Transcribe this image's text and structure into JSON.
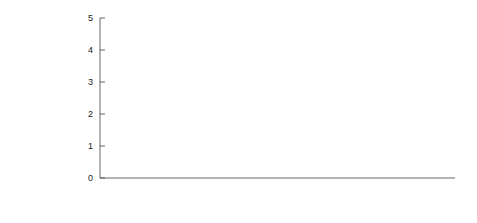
{
  "figure": {
    "background": "#ffffff",
    "xlabel": "Year",
    "left_axis": {
      "label": "Airline fuel cost, $/L",
      "ticks": [
        "0",
        "5",
        "10",
        "15"
      ],
      "tickvals": [
        0,
        5,
        10,
        15
      ],
      "lim": [
        0,
        15
      ]
    },
    "right_axis": {
      "label": "Airline fuel cost, $/gal",
      "ticks": [
        "0",
        "1",
        "2",
        "3",
        "4",
        "5"
      ],
      "tickvals": [
        0,
        1,
        2,
        3,
        4,
        5
      ],
      "lim": [
        0,
        5
      ]
    },
    "xticks": [
      "2000",
      "2002",
      "2004",
      "2006",
      "2008",
      "2010",
      "2012",
      "2014"
    ],
    "xtickvals": [
      2000,
      2002,
      2004,
      2006,
      2008,
      2010,
      2012,
      2014
    ],
    "xlim": [
      2000,
      2014
    ],
    "legend": {
      "position": "top-center-left",
      "entries": [
        {
          "label": "Domestic",
          "color": "#1c1c1c",
          "width": 2.0
        },
        {
          "label": "International",
          "color": "#8a8a8a",
          "width": 1.2
        },
        {
          "label": "Total",
          "color": "#c2c2c2",
          "width": 1.2
        }
      ]
    }
  },
  "chart_data": {
    "type": "line",
    "title": "",
    "xlabel": "Year",
    "ylabel": "Airline fuel cost, $/gal",
    "ylabel_secondary": "Airline fuel cost, $/L",
    "xlim": [
      2000,
      2014
    ],
    "ylim": [
      0,
      5
    ],
    "ylim_secondary": [
      0,
      15
    ],
    "grid": false,
    "legend_position": "upper left of axes",
    "x": [
      2000.0,
      2000.25,
      2000.5,
      2000.75,
      2001.0,
      2001.25,
      2001.5,
      2001.75,
      2002.0,
      2002.25,
      2002.5,
      2002.75,
      2003.0,
      2003.25,
      2003.5,
      2003.75,
      2004.0,
      2004.25,
      2004.5,
      2004.75,
      2005.0,
      2005.25,
      2005.5,
      2005.75,
      2006.0,
      2006.25,
      2006.5,
      2006.75,
      2007.0,
      2007.25,
      2007.5,
      2007.75,
      2008.0,
      2008.25,
      2008.5,
      2008.6,
      2008.75,
      2009.0,
      2009.25,
      2009.5,
      2009.75,
      2010.0,
      2010.25,
      2010.5,
      2010.75,
      2011.0,
      2011.25,
      2011.5,
      2011.75,
      2012.0,
      2012.25,
      2012.5,
      2012.75,
      2013.0,
      2013.25,
      2013.5
    ],
    "series": [
      {
        "name": "Domestic",
        "color": "#1c1c1c",
        "values": [
          0.78,
          0.82,
          0.95,
          0.92,
          0.88,
          0.86,
          0.8,
          0.72,
          0.68,
          0.76,
          0.8,
          0.86,
          0.95,
          0.88,
          0.86,
          0.92,
          1.0,
          1.12,
          1.18,
          1.35,
          1.45,
          1.58,
          1.8,
          1.72,
          1.92,
          2.05,
          2.0,
          1.9,
          1.95,
          2.1,
          2.18,
          2.4,
          2.65,
          3.2,
          3.78,
          3.6,
          2.95,
          1.52,
          1.38,
          1.6,
          1.8,
          1.95,
          2.02,
          1.98,
          2.12,
          2.38,
          2.9,
          2.95,
          2.85,
          3.05,
          3.22,
          3.05,
          3.18,
          3.28,
          3.05,
          3.12
        ]
      },
      {
        "name": "International",
        "color": "#8a8a8a",
        "values": [
          0.8,
          0.86,
          0.99,
          0.96,
          0.92,
          0.9,
          0.84,
          0.76,
          0.72,
          0.8,
          0.84,
          0.9,
          0.99,
          0.92,
          0.9,
          0.96,
          1.05,
          1.17,
          1.23,
          1.4,
          1.5,
          1.64,
          1.86,
          1.78,
          1.98,
          2.12,
          2.06,
          1.96,
          2.02,
          2.17,
          2.26,
          2.5,
          2.78,
          3.35,
          4.05,
          3.85,
          3.1,
          1.56,
          1.42,
          1.66,
          1.86,
          2.01,
          2.08,
          2.04,
          2.18,
          2.45,
          2.98,
          3.03,
          2.93,
          3.13,
          3.31,
          3.13,
          3.27,
          3.37,
          3.13,
          3.05
        ]
      },
      {
        "name": "Total",
        "color": "#c2c2c2",
        "values": [
          0.82,
          0.88,
          1.02,
          0.99,
          0.95,
          0.93,
          0.87,
          0.79,
          0.75,
          0.83,
          0.87,
          0.93,
          1.02,
          0.95,
          0.93,
          0.99,
          1.08,
          1.2,
          1.26,
          1.43,
          1.53,
          1.67,
          1.89,
          1.81,
          2.01,
          2.15,
          2.09,
          1.99,
          2.05,
          2.2,
          2.29,
          2.53,
          2.82,
          3.4,
          4.12,
          3.92,
          3.15,
          1.58,
          1.44,
          1.68,
          1.88,
          2.03,
          2.1,
          2.06,
          2.2,
          2.47,
          3.0,
          3.05,
          2.95,
          3.15,
          3.33,
          3.15,
          3.29,
          3.39,
          3.15,
          3.02
        ]
      }
    ]
  }
}
